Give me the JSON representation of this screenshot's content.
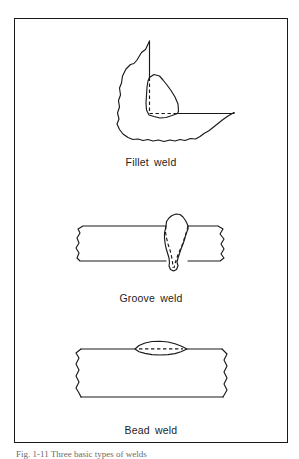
{
  "figure": {
    "background_color": "#ffffff",
    "line_color": "#1a1a1a",
    "frame_border_color": "#1a1a1a",
    "bottom_caption": "Fig. 1-11  Three basic types of welds"
  },
  "panels": [
    {
      "id": "fillet",
      "caption": "Fillet weld",
      "diagram_name": "fillet-weld-diagram",
      "description": "Sectioned fillet weld joining a vertical plate to a horizontal plate, triangular weld bead with dashed fusion boundary"
    },
    {
      "id": "groove",
      "caption": "Groove weld",
      "diagram_name": "groove-weld-diagram",
      "description": "Sectioned butt joint with a V-groove weld filling the gap between two plates, dashed fusion boundary"
    },
    {
      "id": "bead",
      "caption": "Bead weld",
      "diagram_name": "bead-weld-diagram",
      "description": "Sectioned plate with a lens-shaped surface bead weld, dashed fusion boundary"
    }
  ]
}
